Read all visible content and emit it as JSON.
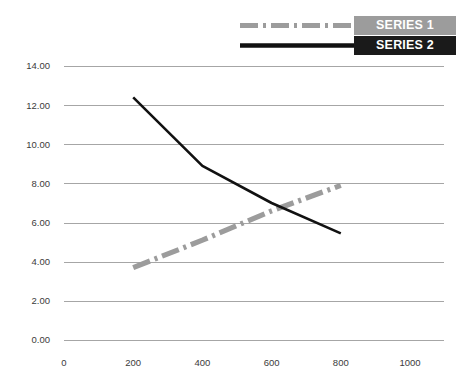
{
  "chart_data": {
    "type": "line",
    "title": "",
    "subtitle": "",
    "xlabel": "",
    "ylabel": "",
    "xlim": [
      0,
      1000
    ],
    "ylim": [
      0,
      14
    ],
    "grid": true,
    "grid_axis": "y",
    "legend_position": "top-right",
    "x_ticks": [
      0,
      200,
      400,
      600,
      800,
      1000
    ],
    "x_tick_labels": [
      "0",
      "200",
      "400",
      "600",
      "800",
      "1000"
    ],
    "y_ticks": [
      0,
      2,
      4,
      6,
      8,
      10,
      12,
      14
    ],
    "y_tick_labels": [
      "0.00",
      "2.00",
      "4.00",
      "6.00",
      "8.00",
      "10.00",
      "12.00",
      "14.00"
    ],
    "series": [
      {
        "name": "SERIES 1",
        "style": "dash-dot",
        "color": "#9c9c9c",
        "x": [
          200,
          400,
          600,
          800
        ],
        "values": [
          3.7,
          5.1,
          6.6,
          7.9
        ]
      },
      {
        "name": "SERIES 2",
        "style": "solid",
        "color": "#111111",
        "x": [
          200,
          400,
          600,
          800
        ],
        "values": [
          12.4,
          8.9,
          7.0,
          5.45
        ]
      }
    ]
  },
  "legend": {
    "items": [
      {
        "label": "SERIES 1",
        "swatch": "dash-dot-line-icon",
        "swatch_color": "#9c9c9c",
        "background": "#9c9c9c"
      },
      {
        "label": "SERIES 2",
        "swatch": "solid-line-icon",
        "swatch_color": "#111111",
        "background": "#1a1a1a"
      }
    ]
  }
}
